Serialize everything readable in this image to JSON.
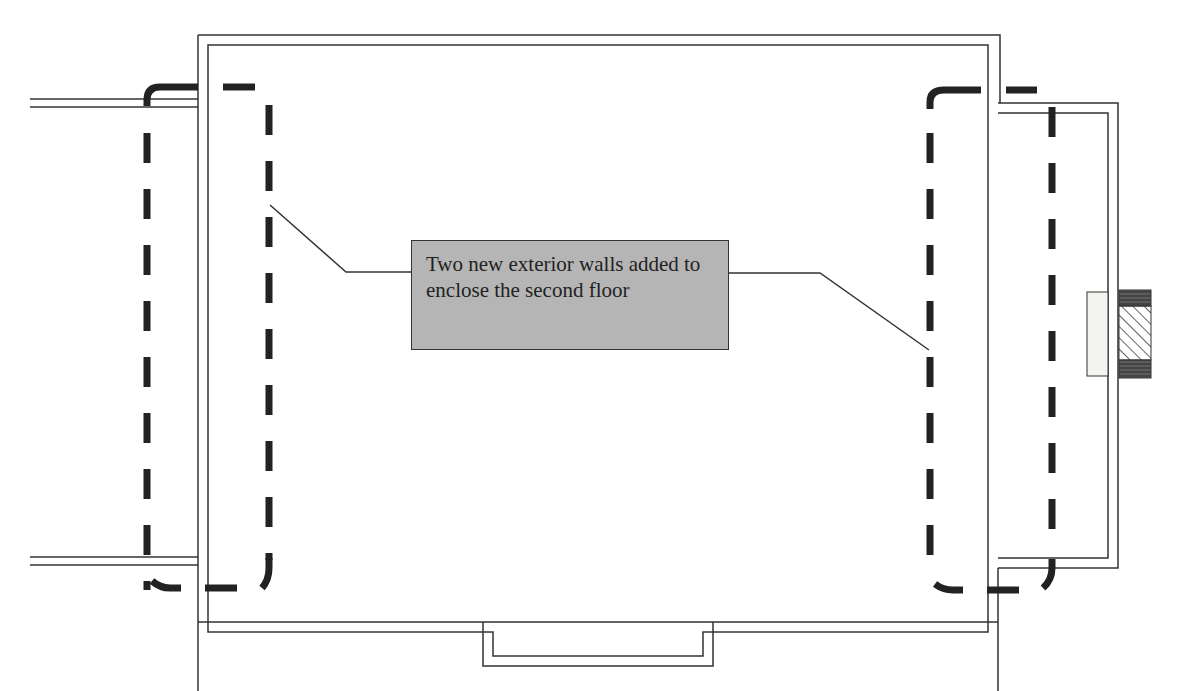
{
  "diagram": {
    "callout": {
      "text": "Two new exterior walls added to enclose the second floor"
    },
    "elements": {
      "main_building": "Existing building outline (double wall line)",
      "left_new_wall": "Dashed thick line marking new exterior wall on left",
      "right_new_wall": "Dashed thick line marking new exterior wall on right",
      "annex": "Attached annex on right side",
      "wall_section_detail": "Wall section with insulation, brick and hatched core"
    },
    "colors": {
      "line": "#333333",
      "dash": "#222222",
      "callout_fill": "#b5b5b5",
      "background": "#ffffff"
    }
  }
}
